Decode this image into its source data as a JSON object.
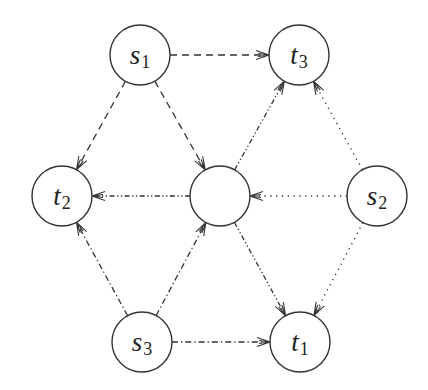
{
  "diagram": {
    "type": "directed-graph",
    "colors": {
      "stroke": "#333333",
      "background": "#ffffff"
    },
    "node_radius": 30,
    "nodes": [
      {
        "id": "s1",
        "base": "s",
        "sub": "1",
        "x": 140,
        "y": 55
      },
      {
        "id": "t3",
        "base": "t",
        "sub": "3",
        "x": 299,
        "y": 55
      },
      {
        "id": "t2",
        "base": "t",
        "sub": "2",
        "x": 62,
        "y": 196
      },
      {
        "id": "m",
        "base": "",
        "sub": "",
        "x": 220,
        "y": 196
      },
      {
        "id": "s2",
        "base": "s",
        "sub": "2",
        "x": 377,
        "y": 196
      },
      {
        "id": "s3",
        "base": "s",
        "sub": "3",
        "x": 142,
        "y": 342
      },
      {
        "id": "t1",
        "base": "t",
        "sub": "1",
        "x": 300,
        "y": 342
      }
    ],
    "edges": [
      {
        "from": "s1",
        "to": "t3",
        "style": "dashed"
      },
      {
        "from": "s1",
        "to": "t2",
        "style": "dashed"
      },
      {
        "from": "s1",
        "to": "m",
        "style": "dashed"
      },
      {
        "from": "s2",
        "to": "t3",
        "style": "dotted"
      },
      {
        "from": "s2",
        "to": "m",
        "style": "dotted"
      },
      {
        "from": "s2",
        "to": "t1",
        "style": "dotted"
      },
      {
        "from": "s3",
        "to": "t2",
        "style": "dash-dot"
      },
      {
        "from": "s3",
        "to": "m",
        "style": "dash-dot"
      },
      {
        "from": "s3",
        "to": "t1",
        "style": "dash-dot"
      },
      {
        "from": "m",
        "to": "t2",
        "style": "dash-dot-dot"
      },
      {
        "from": "m",
        "to": "t3",
        "style": "dash-dot-dot"
      },
      {
        "from": "m",
        "to": "t1",
        "style": "dash-dot-dot"
      }
    ]
  },
  "labels": {
    "s1": {
      "base": "s",
      "sub": "1"
    },
    "t3": {
      "base": "t",
      "sub": "3"
    },
    "t2": {
      "base": "t",
      "sub": "2"
    },
    "s2": {
      "base": "s",
      "sub": "2"
    },
    "s3": {
      "base": "s",
      "sub": "3"
    },
    "t1": {
      "base": "t",
      "sub": "1"
    }
  }
}
